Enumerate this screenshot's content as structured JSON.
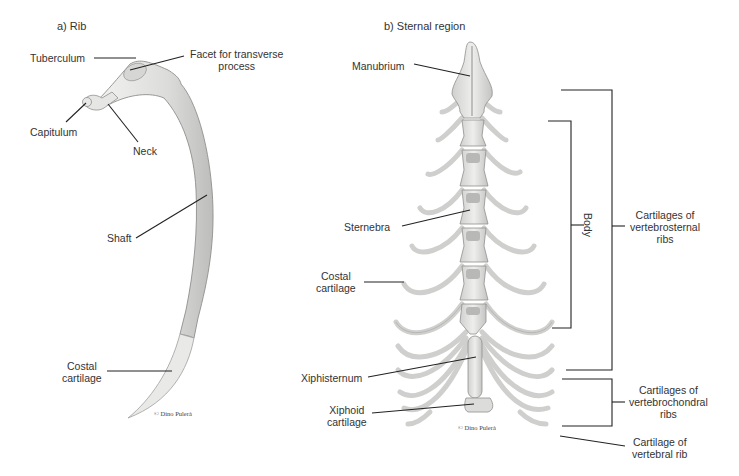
{
  "panels": {
    "a": {
      "title": "a) Rib",
      "labels": {
        "tuberculum": "Tuberculum",
        "facet_line1": "Facet for transverse",
        "facet_line2": "process",
        "capitulum": "Capitulum",
        "neck": "Neck",
        "shaft": "Shaft",
        "costal_line1": "Costal",
        "costal_line2": "cartilage"
      },
      "credit": "© Dino Pulerà"
    },
    "b": {
      "title": "b) Sternal region",
      "labels": {
        "manubrium": "Manubrium",
        "sternebra": "Sternebra",
        "costal_line1": "Costal",
        "costal_line2": "cartilage",
        "xiphisternum": "Xiphisternum",
        "xiphoid_line1": "Xiphoid",
        "xiphoid_line2": "cartilage",
        "body": "Body",
        "vertebrosternal_line1": "Cartilages of",
        "vertebrosternal_line2": "vertebrosternal",
        "vertebrosternal_line3": "ribs",
        "vertebrochondral_line1": "Cartilages of",
        "vertebrochondral_line2": "vertebrochondral",
        "vertebrochondral_line3": "ribs",
        "vertebral_line1": "Cartilage of",
        "vertebral_line2": "vertebral rib"
      },
      "credit": "© Dino Pulerà"
    }
  },
  "colors": {
    "bone_fill": "#e4e4e2",
    "bone_stroke": "#9a9a98",
    "bone_shadow": "#c8c8c6",
    "leader_line": "#222222",
    "text": "#333333"
  }
}
